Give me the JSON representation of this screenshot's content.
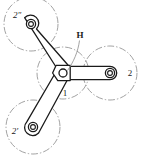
{
  "figure": {
    "background_color": "#ffffff",
    "line_color": "#1a1a1a",
    "construction_line_color": "#8a8a8a",
    "width": 144,
    "height": 158
  },
  "labels": {
    "top_left_circle": "2″",
    "right_circle": "2",
    "bottom_left_circle": "2′",
    "hub": "1",
    "leader": "H"
  },
  "elements": {
    "hub_pivot_name": "center-pivot",
    "arm_count": 3,
    "pivot_count": 4
  },
  "geometry": {
    "hub": {
      "cx": 63,
      "cy": 73,
      "pitch_r": 26
    },
    "planets": [
      {
        "id": "top-left",
        "cx": 31,
        "cy": 24,
        "r": 27,
        "label": "2″"
      },
      {
        "id": "right",
        "cx": 110,
        "cy": 73,
        "r": 27,
        "label": "2"
      },
      {
        "id": "bottom-left",
        "cx": 33,
        "cy": 127,
        "r": 27,
        "label": "2′"
      }
    ]
  }
}
